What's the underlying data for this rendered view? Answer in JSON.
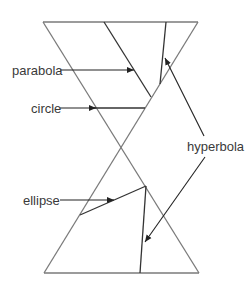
{
  "diagram": {
    "labels": {
      "parabola": "parabola",
      "circle": "circle",
      "ellipse": "ellipse",
      "hyperbola": "hyperbola"
    },
    "colors": {
      "cone_stroke": "#7a7a7a",
      "section_stroke": "#333333",
      "arrow_stroke": "#222222",
      "text": "#3a3a3a"
    }
  }
}
